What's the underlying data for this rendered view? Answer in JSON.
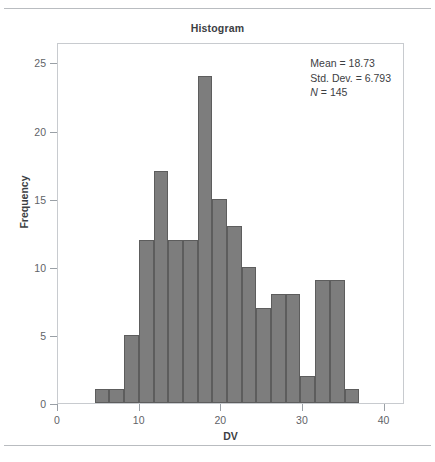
{
  "chart_data": {
    "type": "bar",
    "title": "Histogram",
    "xlabel": "DV",
    "ylabel": "Frequency",
    "xlim": [
      0,
      42.5
    ],
    "ylim": [
      0,
      26.5
    ],
    "grid": false,
    "legend": null,
    "bar_color": "#7d7d7d",
    "bar_edge_color": "#5d5d5d",
    "bin_width": 1.8,
    "x_ticks": [
      0,
      10,
      20,
      30,
      40
    ],
    "x_tick_labels": [
      "0",
      "10",
      "20",
      "30",
      "40"
    ],
    "y_ticks": [
      0,
      5,
      10,
      15,
      20,
      25
    ],
    "y_tick_labels": [
      "0",
      "5",
      "10",
      "15",
      "20",
      "25"
    ],
    "bins": [
      {
        "x_start": 4.5,
        "x_end": 6.3,
        "center": 5.4,
        "value": 1
      },
      {
        "x_start": 6.3,
        "x_end": 8.1,
        "center": 7.2,
        "value": 1
      },
      {
        "x_start": 8.1,
        "x_end": 9.9,
        "center": 9.0,
        "value": 5
      },
      {
        "x_start": 9.9,
        "x_end": 11.7,
        "center": 10.8,
        "value": 12
      },
      {
        "x_start": 11.7,
        "x_end": 13.5,
        "center": 12.6,
        "value": 17
      },
      {
        "x_start": 13.5,
        "x_end": 15.3,
        "center": 14.4,
        "value": 12
      },
      {
        "x_start": 15.3,
        "x_end": 17.1,
        "center": 16.2,
        "value": 12
      },
      {
        "x_start": 17.1,
        "x_end": 18.9,
        "center": 18.0,
        "value": 24
      },
      {
        "x_start": 18.9,
        "x_end": 20.7,
        "center": 19.8,
        "value": 15
      },
      {
        "x_start": 20.7,
        "x_end": 22.5,
        "center": 21.6,
        "value": 13
      },
      {
        "x_start": 22.5,
        "x_end": 24.3,
        "center": 23.4,
        "value": 10
      },
      {
        "x_start": 24.3,
        "x_end": 26.1,
        "center": 25.2,
        "value": 7
      },
      {
        "x_start": 26.1,
        "x_end": 27.9,
        "center": 27.0,
        "value": 8
      },
      {
        "x_start": 27.9,
        "x_end": 29.7,
        "center": 28.8,
        "value": 8
      },
      {
        "x_start": 29.7,
        "x_end": 31.5,
        "center": 30.6,
        "value": 2
      },
      {
        "x_start": 31.5,
        "x_end": 33.3,
        "center": 32.4,
        "value": 9
      },
      {
        "x_start": 33.3,
        "x_end": 35.1,
        "center": 34.2,
        "value": 9
      },
      {
        "x_start": 35.1,
        "x_end": 36.9,
        "center": 36.0,
        "value": 1
      }
    ],
    "categories": [
      "5.4",
      "7.2",
      "9.0",
      "10.8",
      "12.6",
      "14.4",
      "16.2",
      "18.0",
      "19.8",
      "21.6",
      "23.4",
      "25.2",
      "27.0",
      "28.8",
      "30.6",
      "32.4",
      "34.2",
      "36.0"
    ],
    "values": [
      1,
      1,
      5,
      12,
      17,
      12,
      12,
      24,
      15,
      13,
      10,
      7,
      8,
      8,
      2,
      9,
      9,
      1
    ],
    "annotations": {
      "mean_label": "Mean = 18.73",
      "std_dev_label": "Std. Dev. = 6.793",
      "n_symbol": "N",
      "n_value": " = 145",
      "mean": 18.73,
      "std_dev": 6.793,
      "n": 145
    }
  }
}
